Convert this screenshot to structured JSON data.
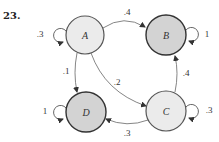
{
  "problem_number": "23.",
  "nodes": [
    {
      "id": "A",
      "label": "A",
      "cx": 85,
      "cy": 35,
      "r": 19,
      "fill": "#ebebeb"
    },
    {
      "id": "B",
      "label": "B",
      "cx": 166,
      "cy": 35,
      "r": 20,
      "fill": "#d3d3d3"
    },
    {
      "id": "C",
      "label": "C",
      "cx": 166,
      "cy": 111,
      "r": 20,
      "fill": "#ebebeb"
    },
    {
      "id": "D",
      "label": "D",
      "cx": 86,
      "cy": 112,
      "r": 20,
      "fill": "#d3d3d3"
    }
  ],
  "edges": [
    {
      "from": "A",
      "to": "A",
      "label": ".3"
    },
    {
      "from": "A",
      "to": "B",
      "label": ".4"
    },
    {
      "from": "A",
      "to": "C",
      "label": ".2"
    },
    {
      "from": "A",
      "to": "D",
      "label": ".1"
    },
    {
      "from": "B",
      "to": "B",
      "label": "1"
    },
    {
      "from": "C",
      "to": "B",
      "label": ".4"
    },
    {
      "from": "C",
      "to": "C",
      "label": ".3"
    },
    {
      "from": "C",
      "to": "D",
      "label": ".3"
    },
    {
      "from": "D",
      "to": "D",
      "label": "1"
    }
  ]
}
